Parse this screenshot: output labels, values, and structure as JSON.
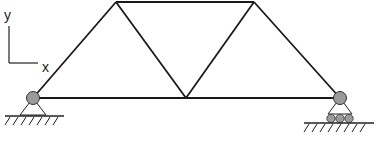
{
  "diagram": {
    "type": "truss",
    "axes": {
      "y_label": "y",
      "x_label": "x"
    },
    "nodes": [
      {
        "id": "A",
        "x": 33,
        "y": 98,
        "support": "pin"
      },
      {
        "id": "B",
        "x": 116,
        "y": 2
      },
      {
        "id": "C",
        "x": 186,
        "y": 98
      },
      {
        "id": "D",
        "x": 254,
        "y": 2
      },
      {
        "id": "E",
        "x": 340,
        "y": 98,
        "support": "roller"
      }
    ],
    "members": [
      [
        "A",
        "B"
      ],
      [
        "B",
        "D"
      ],
      [
        "A",
        "C"
      ],
      [
        "C",
        "E"
      ],
      [
        "B",
        "C"
      ],
      [
        "C",
        "D"
      ],
      [
        "D",
        "E"
      ]
    ],
    "colors": {
      "line": "#1a1a1a",
      "joint_fill": "#9a9a9a"
    }
  }
}
